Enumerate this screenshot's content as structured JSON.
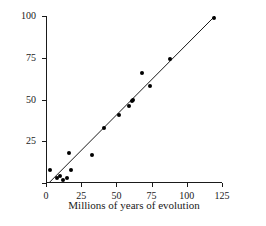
{
  "chart_data": {
    "type": "scatter",
    "title": "",
    "xlabel": "Millions of years of evolution",
    "ylabel": "Nucleotide substitutions",
    "xlim": [
      0,
      125
    ],
    "ylim": [
      0,
      100
    ],
    "xticks": [
      0,
      25,
      50,
      75,
      100,
      125
    ],
    "yticks": [
      0,
      25,
      50,
      75,
      100
    ],
    "xtick_labels": [
      "0",
      "25",
      "50",
      "75",
      "100",
      "125"
    ],
    "ytick_labels": [
      "25",
      "50",
      "75",
      "100"
    ],
    "grid": false,
    "legend": false,
    "marker_color": "#000000",
    "line_color": "#1a1a1a",
    "axis_color": "#1a1a1a",
    "background": "#ffffff",
    "points": [
      {
        "x": 3,
        "y": 8
      },
      {
        "x": 8,
        "y": 3
      },
      {
        "x": 10,
        "y": 4
      },
      {
        "x": 12,
        "y": 2
      },
      {
        "x": 15,
        "y": 3
      },
      {
        "x": 16,
        "y": 18
      },
      {
        "x": 18,
        "y": 8
      },
      {
        "x": 33,
        "y": 17
      },
      {
        "x": 41,
        "y": 33
      },
      {
        "x": 52,
        "y": 41
      },
      {
        "x": 59,
        "y": 46
      },
      {
        "x": 61,
        "y": 49
      },
      {
        "x": 62,
        "y": 50
      },
      {
        "x": 68,
        "y": 66
      },
      {
        "x": 74,
        "y": 58
      },
      {
        "x": 88,
        "y": 74
      },
      {
        "x": 119,
        "y": 99
      }
    ],
    "trendline": {
      "type": "linear",
      "x_start": 2,
      "y_start": 0,
      "x_end": 120,
      "y_end": 100
    }
  }
}
